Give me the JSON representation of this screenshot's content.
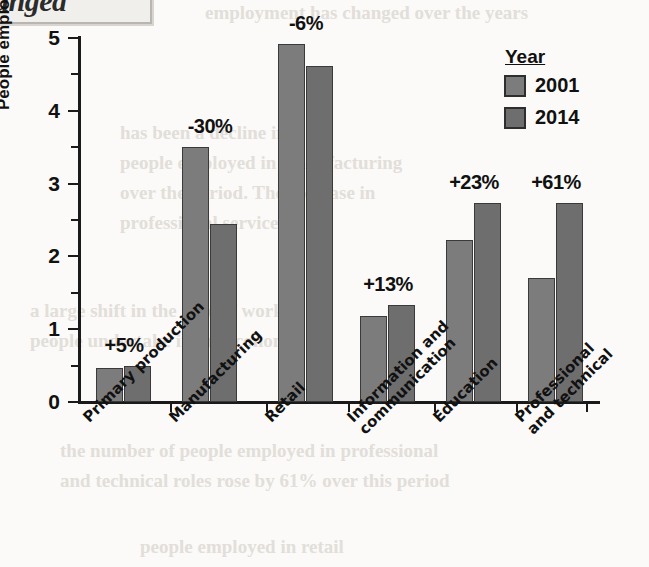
{
  "page": {
    "header_fragment": "anged",
    "bleed_text": [
      "How",
      "employment",
      "has",
      "changed",
      "over",
      "the",
      "years"
    ]
  },
  "legend": {
    "title": "Year",
    "entries": [
      {
        "label": "2001",
        "color": "#7c7c7c"
      },
      {
        "label": "2014",
        "color": "#6e6e6e"
      }
    ],
    "position": "top-right"
  },
  "chart_data": {
    "type": "bar",
    "title": "",
    "xlabel": "",
    "ylabel": "People employed (millions)",
    "ylim": [
      0,
      5
    ],
    "yticks": [
      "0",
      "1",
      "2",
      "3",
      "4",
      "5"
    ],
    "minor_tick_interval": 0.5,
    "grid": false,
    "categories": [
      "Primary production",
      "Manufacturing",
      "Retail",
      "Information and communication",
      "Education",
      "Professional and technical"
    ],
    "series": [
      {
        "name": "2001",
        "values": [
          0.47,
          3.5,
          4.92,
          1.18,
          2.22,
          1.7
        ]
      },
      {
        "name": "2014",
        "values": [
          0.49,
          2.44,
          4.61,
          1.33,
          2.73,
          2.74
        ]
      }
    ],
    "annotations": [
      "+5%",
      "-30%",
      "-6%",
      "+13%",
      "+23%",
      "+61%"
    ]
  }
}
